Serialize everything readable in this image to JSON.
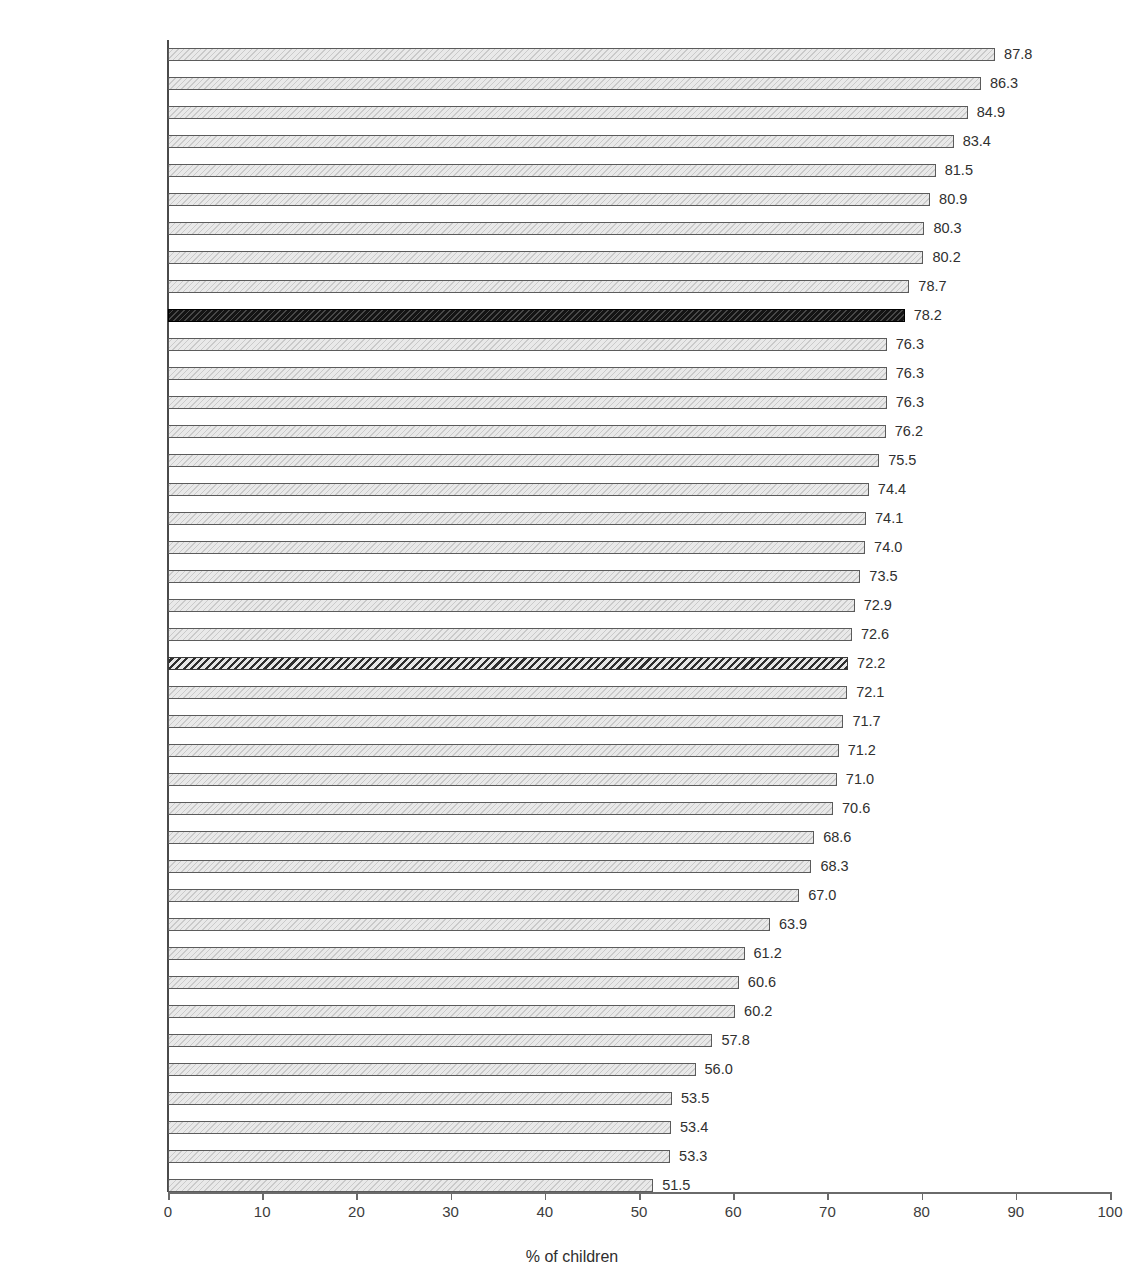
{
  "chart_data": {
    "type": "bar",
    "orientation": "horizontal",
    "title": "",
    "xlabel": "% of children",
    "ylabel": "",
    "xlim": [
      0,
      100
    ],
    "xticks": [
      0,
      10,
      20,
      30,
      40,
      50,
      60,
      70,
      80,
      90,
      100
    ],
    "grid": false,
    "legend": null,
    "value_label_format": "one-decimal",
    "categories": [
      "Portugal",
      "Netherlands",
      "Sweden",
      "Denmark",
      "Belgium (Flemish)",
      "Norway",
      "Spain",
      "Iceland",
      "Finland",
      "Ireland",
      "Ukraine",
      "France",
      "Estonia",
      "Latvia",
      "Bulgaria",
      "Macedonia",
      "Poland",
      "England",
      "Belgium (French)",
      "Canada",
      "Lithuania",
      "HBSC Average",
      "Croatia",
      "Turkey",
      "Germany",
      "Scotland",
      "Russia",
      "Wales",
      "Luxembourg",
      "Greenland",
      "Switzerland",
      "Slovakia",
      "USA",
      "Hungary",
      "Czech Republic",
      "Romania",
      "Slovenia",
      "Israel",
      "Malta",
      "Greece"
    ],
    "values": [
      87.8,
      86.3,
      84.9,
      83.4,
      81.5,
      80.9,
      80.3,
      80.2,
      78.7,
      78.2,
      76.3,
      76.3,
      76.3,
      76.2,
      75.5,
      74.4,
      74.1,
      74.0,
      73.5,
      72.9,
      72.6,
      72.2,
      72.1,
      71.7,
      71.2,
      71.0,
      70.6,
      68.6,
      68.3,
      67.0,
      63.9,
      61.2,
      60.6,
      60.2,
      57.8,
      56.0,
      53.5,
      53.4,
      53.3,
      51.5
    ],
    "value_labels": [
      "87.8",
      "86.3",
      "84.9",
      "83.4",
      "81.5",
      "80.9",
      "80.3",
      "80.2",
      "78.7",
      "78.2",
      "76.3",
      "76.3",
      "76.3",
      "76.2",
      "75.5",
      "74.4",
      "74.1",
      "74.0",
      "73.5",
      "72.9",
      "72.6",
      "72.2",
      "72.1",
      "71.7",
      "71.2",
      "71.0",
      "70.6",
      "68.6",
      "68.3",
      "67.0",
      "63.9",
      "61.2",
      "60.6",
      "60.2",
      "57.8",
      "56.0",
      "53.5",
      "53.4",
      "53.3",
      "51.5"
    ],
    "styles": [
      "normal",
      "normal",
      "normal",
      "normal",
      "normal",
      "normal",
      "normal",
      "normal",
      "normal",
      "highlight",
      "normal",
      "normal",
      "normal",
      "normal",
      "normal",
      "normal",
      "normal",
      "normal",
      "normal",
      "normal",
      "normal",
      "average",
      "normal",
      "normal",
      "normal",
      "normal",
      "normal",
      "normal",
      "normal",
      "normal",
      "normal",
      "normal",
      "normal",
      "normal",
      "normal",
      "normal",
      "normal",
      "normal",
      "normal",
      "normal"
    ],
    "colors": {
      "bar_fill": "#e9e9e9",
      "bar_stroke": "#5b5b5b",
      "highlight_fill": "#141414",
      "average_fill": "#d8d8d8",
      "average_stroke": "#3a3a3a",
      "axis": "#6a6a6a",
      "text": "#3c3c3c"
    }
  }
}
